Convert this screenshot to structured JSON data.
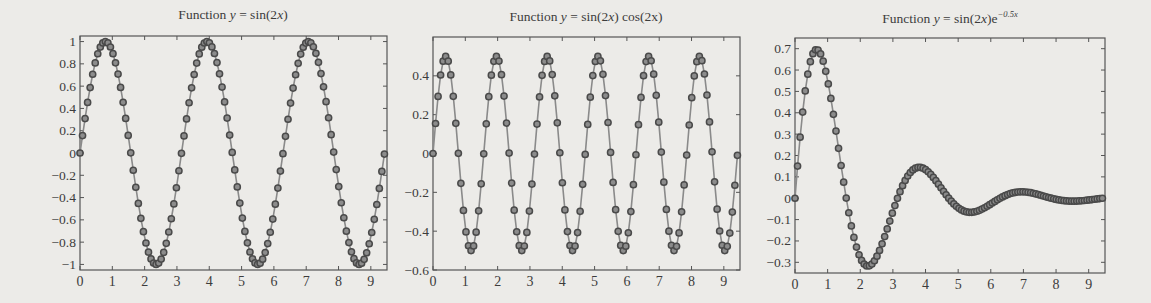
{
  "figure": {
    "background": "#ecebe8",
    "line_color": "#8a8a8a",
    "marker_edge_color": "#4a4a4a",
    "marker_face_color": "#8c8c8c",
    "axis_color": "#555555"
  },
  "panels": [
    {
      "title_prefix": "Function ",
      "title_var": "y",
      "title_expr": " = sin(2",
      "title_var2": "x",
      "title_suffix": ")",
      "title_full": "Function y = sin(2x)"
    },
    {
      "title_prefix": "Function ",
      "title_var": "y",
      "title_expr": " = sin(2",
      "title_var2": "x",
      "title_suffix": ") cos(2x)",
      "title_full": "Function y = sin(2x) cos(2x)"
    },
    {
      "title_prefix": "Function ",
      "title_var": "y",
      "title_expr": " = sin(2",
      "title_var2": "x",
      "title_suffix": ")e",
      "title_sup": "−0.5x",
      "title_full": "Function y = sin(2x)e^(-0.5x)"
    }
  ],
  "chart_data": [
    {
      "type": "line",
      "title": "Function y = sin(2x)",
      "function": "sin(2x)",
      "xlabel": "",
      "ylabel": "",
      "xlim": [
        0,
        9.5
      ],
      "ylim": [
        -1.05,
        1.05
      ],
      "xticks": [
        0,
        1,
        2,
        3,
        4,
        5,
        6,
        7,
        8,
        9
      ],
      "xtick_labels": [
        "0",
        "1",
        "2",
        "3",
        "4",
        "5",
        "6",
        "7",
        "8",
        "9"
      ],
      "yticks": [
        -1,
        -0.8,
        -0.6,
        -0.4,
        -0.2,
        0,
        0.2,
        0.4,
        0.6,
        0.8,
        1
      ],
      "ytick_labels": [
        "−1",
        "−0.8",
        "−0.6",
        "−0.4",
        "−0.2",
        "0",
        "0.2",
        "0.4",
        "0.6",
        "0.8",
        "1"
      ],
      "grid": false,
      "legend": null,
      "marker": "o",
      "x_range": [
        0,
        9.42
      ],
      "n_points": 121,
      "key_points": {
        "peaks_x": [
          0.79,
          3.93,
          7.07
        ],
        "peak_y": 1,
        "troughs_x": [
          2.36,
          5.5,
          8.64
        ],
        "trough_y": -1
      }
    },
    {
      "type": "line",
      "title": "Function y = sin(2x) cos(2x)",
      "function": "sin(2x)*cos(2x)",
      "xlabel": "",
      "ylabel": "",
      "xlim": [
        0,
        9.5
      ],
      "ylim": [
        -0.6,
        0.6
      ],
      "xticks": [
        0,
        1,
        2,
        3,
        4,
        5,
        6,
        7,
        8,
        9
      ],
      "xtick_labels": [
        "0",
        "1",
        "2",
        "3",
        "4",
        "5",
        "6",
        "7",
        "8",
        "9"
      ],
      "yticks": [
        -0.6,
        -0.4,
        -0.2,
        0,
        0.2,
        0.4
      ],
      "ytick_labels": [
        "−0.6",
        "−0.4",
        "−0.2",
        "0",
        "0.2",
        "0.4"
      ],
      "grid": false,
      "legend": null,
      "marker": "o",
      "x_range": [
        0,
        9.42
      ],
      "n_points": 121,
      "key_points": {
        "peak_y": 0.5,
        "trough_y": -0.5,
        "period": 1.571
      }
    },
    {
      "type": "line",
      "title": "Function y = sin(2x)e^(-0.5x)",
      "function": "sin(2x)*exp(-0.5x)",
      "xlabel": "",
      "ylabel": "",
      "xlim": [
        0,
        9.5
      ],
      "ylim": [
        -0.35,
        0.75
      ],
      "xticks": [
        0,
        1,
        2,
        3,
        4,
        5,
        6,
        7,
        8,
        9
      ],
      "xtick_labels": [
        "0",
        "1",
        "2",
        "3",
        "4",
        "5",
        "6",
        "7",
        "8",
        "9"
      ],
      "yticks": [
        -0.3,
        -0.2,
        -0.1,
        0,
        0.1,
        0.2,
        0.3,
        0.4,
        0.5,
        0.6,
        0.7
      ],
      "ytick_labels": [
        "−0.3",
        "−0.2",
        "−0.1",
        "0",
        "0.1",
        "0.2",
        "0.3",
        "0.4",
        "0.5",
        "0.6",
        "0.7"
      ],
      "grid": false,
      "legend": null,
      "marker": "o",
      "x_range": [
        0,
        9.42
      ],
      "n_points": 121,
      "key_points": {
        "max": [
          0.66,
          0.69
        ],
        "min": [
          2.23,
          -0.32
        ],
        "local_max_2": [
          3.8,
          0.14
        ],
        "local_min_2": [
          5.4,
          -0.07
        ],
        "local_max_3": [
          6.9,
          0.03
        ]
      }
    }
  ]
}
